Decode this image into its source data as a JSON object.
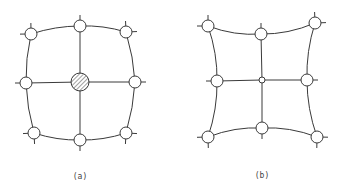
{
  "figure": {
    "panels": [
      {
        "id": "a",
        "caption": "(a)",
        "caption_pos": [
          80,
          179
        ],
        "center_node": {
          "x": 80,
          "y": 82,
          "r": 9,
          "style": "hatched"
        },
        "nodes": [
          {
            "name": "top-left",
            "x": 31,
            "y": 34,
            "r": 6,
            "stubs": [
              [
                -45,
                9
              ],
              [
                45,
                9
              ]
            ]
          },
          {
            "name": "top-middle",
            "x": 80,
            "y": 26,
            "r": 6,
            "stubs": [
              [
                -90,
                9
              ]
            ]
          },
          {
            "name": "top-right",
            "x": 126,
            "y": 32,
            "r": 6,
            "stubs": [
              [
                -45,
                9
              ],
              [
                45,
                9
              ]
            ]
          },
          {
            "name": "middle-left",
            "x": 26,
            "y": 83,
            "r": 6,
            "stubs": [
              [
                180,
                9
              ]
            ]
          },
          {
            "name": "middle-right",
            "x": 135,
            "y": 82,
            "r": 6,
            "stubs": [
              [
                0,
                9
              ]
            ]
          },
          {
            "name": "bottom-left",
            "x": 34,
            "y": 133,
            "r": 6,
            "stubs": [
              [
                -45,
                9
              ],
              [
                45,
                9
              ]
            ]
          },
          {
            "name": "bottom-middle",
            "x": 80,
            "y": 140,
            "r": 6,
            "stubs": [
              [
                90,
                9
              ]
            ]
          },
          {
            "name": "bottom-right",
            "x": 126,
            "y": 133,
            "r": 6,
            "stubs": [
              [
                -45,
                9
              ],
              [
                45,
                9
              ]
            ]
          }
        ],
        "boundary_shape": "convex"
      },
      {
        "id": "b",
        "caption": "(b)",
        "caption_pos": [
          262,
          178
        ],
        "center_node": {
          "x": 262,
          "y": 80,
          "r": 3,
          "style": "small"
        },
        "nodes": [
          {
            "name": "top-left",
            "x": 208,
            "y": 26,
            "r": 6,
            "stubs": [
              [
                -45,
                9
              ],
              [
                45,
                9
              ]
            ]
          },
          {
            "name": "top-middle",
            "x": 261,
            "y": 34,
            "r": 6,
            "stubs": [
              [
                -90,
                9
              ]
            ]
          },
          {
            "name": "top-right",
            "x": 315,
            "y": 23,
            "r": 6,
            "stubs": [
              [
                -45,
                9
              ],
              [
                45,
                9
              ]
            ]
          },
          {
            "name": "middle-left",
            "x": 217,
            "y": 81,
            "r": 6,
            "stubs": [
              [
                180,
                9
              ]
            ]
          },
          {
            "name": "middle-right",
            "x": 307,
            "y": 80,
            "r": 6,
            "stubs": [
              [
                0,
                9
              ]
            ]
          },
          {
            "name": "bottom-left",
            "x": 208,
            "y": 137,
            "r": 6,
            "stubs": [
              [
                -45,
                9
              ],
              [
                45,
                9
              ]
            ]
          },
          {
            "name": "bottom-middle",
            "x": 262,
            "y": 128,
            "r": 6,
            "stubs": [
              [
                90,
                9
              ]
            ]
          },
          {
            "name": "bottom-right",
            "x": 317,
            "y": 137,
            "r": 6,
            "stubs": [
              [
                -45,
                9
              ],
              [
                45,
                9
              ]
            ]
          }
        ],
        "boundary_shape": "concave"
      }
    ]
  }
}
